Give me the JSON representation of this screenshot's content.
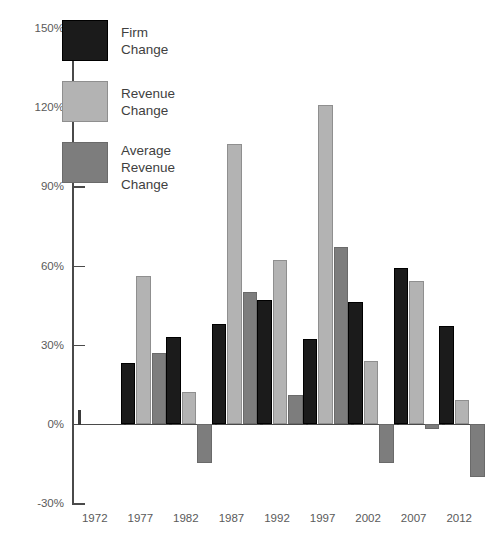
{
  "chart_data": {
    "type": "bar",
    "title": "",
    "xlabel": "",
    "ylabel": "",
    "ylim": [
      -30,
      150
    ],
    "ytick_step": 30,
    "grid": false,
    "legend_position": "top-left",
    "categories": [
      "1972",
      "1977",
      "1982",
      "1987",
      "1992",
      "1997",
      "2002",
      "2007",
      "2012"
    ],
    "ytick_labels": [
      "150%",
      "120%",
      "90%",
      "60%",
      "30%",
      "0%",
      "-30%"
    ],
    "ytick_values": [
      150,
      120,
      90,
      60,
      30,
      0,
      -30
    ],
    "series": [
      {
        "name": "Firm Change",
        "color": "#1b1b1b",
        "values": [
          null,
          23,
          33,
          38,
          47,
          32,
          46,
          59,
          37
        ]
      },
      {
        "name": "Revenue Change",
        "color": "#b3b3b3",
        "values": [
          null,
          56,
          12,
          106,
          62,
          121,
          24,
          54,
          9
        ]
      },
      {
        "name": "Average Revenue Change",
        "color": "#7d7d7d",
        "values": [
          null,
          27,
          -15,
          50,
          11,
          67,
          -15,
          -2,
          -20
        ]
      }
    ]
  },
  "legend": {
    "items": [
      {
        "label": "Firm Change",
        "swatch": "firm"
      },
      {
        "label": "Revenue Change",
        "swatch": "revenue"
      },
      {
        "label": "Average\nRevenue\nChange",
        "swatch": "avg"
      }
    ]
  },
  "axis": {
    "y_labels": [
      "150%",
      "120%",
      "90%",
      "60%",
      "30%",
      "0%",
      "-30%"
    ],
    "x_labels": [
      "1972",
      "1977",
      "1982",
      "1987",
      "1992",
      "1997",
      "2002",
      "2007",
      "2012"
    ]
  }
}
